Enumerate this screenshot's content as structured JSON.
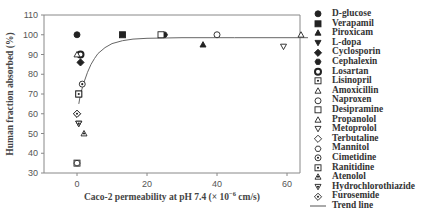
{
  "chart_data": {
    "type": "scatter",
    "title": "",
    "xlabel": "Caco-2 permeability at pH 7.4 (× 10⁻⁶ cm/s)",
    "ylabel": "Human fraction absorbed (%)",
    "xlim": [
      -8,
      66
    ],
    "ylim": [
      30,
      110
    ],
    "xticks": [
      0,
      20,
      40,
      60
    ],
    "yticks": [
      30,
      40,
      50,
      60,
      70,
      80,
      90,
      100,
      110
    ],
    "grid": false,
    "legend_position": "right",
    "series": [
      {
        "name": "D-glucose",
        "marker": "circle-filled",
        "points": [
          [
            0,
            100
          ]
        ]
      },
      {
        "name": "Verapamil",
        "marker": "square-filled",
        "points": [
          [
            13,
            100
          ]
        ]
      },
      {
        "name": "Piroxicam",
        "marker": "triangle-up-filled",
        "points": [
          [
            36,
            95
          ]
        ]
      },
      {
        "name": "L-dopa",
        "marker": "triangle-down-filled",
        "points": [
          [
            0.5,
            55
          ]
        ]
      },
      {
        "name": "Cyclosporin",
        "marker": "diamond-filled",
        "points": [
          [
            1,
            86
          ]
        ]
      },
      {
        "name": "Cephalexin",
        "marker": "hexagon-filled",
        "points": [
          [
            25,
            100
          ]
        ]
      },
      {
        "name": "Losartan",
        "marker": "circle-thick",
        "points": [
          [
            1,
            90
          ]
        ]
      },
      {
        "name": "Lisinopril",
        "marker": "square-dot",
        "points": [
          [
            0.5,
            70
          ]
        ]
      },
      {
        "name": "Amoxicillin",
        "marker": "triangle-up-open",
        "points": [
          [
            0,
            90
          ]
        ]
      },
      {
        "name": "Naproxen",
        "marker": "circle-open",
        "points": [
          [
            40,
            100
          ]
        ]
      },
      {
        "name": "Desipramine",
        "marker": "square-open",
        "points": [
          [
            24,
            100
          ],
          [
            0,
            35
          ]
        ]
      },
      {
        "name": "Propanolol",
        "marker": "triangle-up-open",
        "points": [
          [
            64,
            100
          ]
        ]
      },
      {
        "name": "Metoprolol",
        "marker": "triangle-down-open",
        "points": [
          [
            59,
            94
          ]
        ]
      },
      {
        "name": "Terbutaline",
        "marker": "diamond-open",
        "points": [
          [
            0,
            60
          ]
        ]
      },
      {
        "name": "Mannitol",
        "marker": "hexagon-open",
        "points": [
          [
            0,
            35
          ]
        ]
      },
      {
        "name": "Cimetidine",
        "marker": "circle-dot",
        "points": [
          [
            1.5,
            75
          ]
        ]
      },
      {
        "name": "Ranitidine",
        "marker": "square-dot",
        "points": [
          [
            0.5,
            70
          ]
        ]
      },
      {
        "name": "Atenolol",
        "marker": "triangle-up-dot",
        "points": [
          [
            2,
            50
          ]
        ]
      },
      {
        "name": "Hydrochlorothiazide",
        "marker": "triangle-down-dot",
        "points": [
          [
            0.5,
            55
          ]
        ]
      },
      {
        "name": "Furosemide",
        "marker": "diamond-dot",
        "points": [
          [
            0,
            60
          ]
        ]
      }
    ],
    "trend_line": {
      "name": "Trend line",
      "points": [
        [
          0.5,
          65
        ],
        [
          1,
          70
        ],
        [
          2,
          76
        ],
        [
          3,
          81
        ],
        [
          4,
          85
        ],
        [
          5,
          88
        ],
        [
          6,
          90.5
        ],
        [
          8,
          93.5
        ],
        [
          10,
          95.5
        ],
        [
          13,
          97
        ],
        [
          16,
          97.8
        ],
        [
          20,
          98.2
        ],
        [
          30,
          98.5
        ],
        [
          45,
          98.5
        ],
        [
          66,
          98.5
        ]
      ]
    }
  },
  "axes": {
    "x_title": "Caco-2 permeability at pH 7.4 (× 10",
    "x_title_exp": "−6",
    "x_title_end": " cm/s)",
    "y_title": "Human fraction absorbed (%)",
    "x_ticks": [
      "0",
      "20",
      "40",
      "60"
    ],
    "y_ticks": [
      "30",
      "40",
      "50",
      "60",
      "70",
      "80",
      "90",
      "100",
      "110"
    ]
  },
  "legend": {
    "items": [
      {
        "label": "D-glucose",
        "icon": "circle-filled"
      },
      {
        "label": "Verapamil",
        "icon": "square-filled"
      },
      {
        "label": "Piroxicam",
        "icon": "triangle-up-filled"
      },
      {
        "label": "L-dopa",
        "icon": "triangle-down-filled"
      },
      {
        "label": "Cyclosporin",
        "icon": "diamond-filled"
      },
      {
        "label": "Cephalexin",
        "icon": "hexagon-filled"
      },
      {
        "label": "Losartan",
        "icon": "circle-thick"
      },
      {
        "label": "Lisinopril",
        "icon": "square-dot"
      },
      {
        "label": "Amoxicillin",
        "icon": "triangle-up-open"
      },
      {
        "label": "Naproxen",
        "icon": "circle-open"
      },
      {
        "label": "Desipramine",
        "icon": "square-open"
      },
      {
        "label": "Propanolol",
        "icon": "triangle-up-open"
      },
      {
        "label": "Metoprolol",
        "icon": "triangle-down-open"
      },
      {
        "label": "Terbutaline",
        "icon": "diamond-open"
      },
      {
        "label": "Mannitol",
        "icon": "hexagon-open"
      },
      {
        "label": "Cimetidine",
        "icon": "circle-dot"
      },
      {
        "label": "Ranitidine",
        "icon": "square-dot"
      },
      {
        "label": "Atenolol",
        "icon": "triangle-up-dot"
      },
      {
        "label": "Hydrochlorothiazide",
        "icon": "triangle-down-dot"
      },
      {
        "label": "Furosemide",
        "icon": "diamond-dot"
      },
      {
        "label": "Trend line",
        "icon": "line"
      }
    ]
  }
}
